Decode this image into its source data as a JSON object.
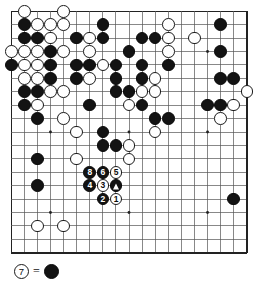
{
  "figure": {
    "kind": "go-board-diagram",
    "board_size": 19,
    "colors": {
      "black_stone": "#131313",
      "white_stone": "#ffffff",
      "stone_outline": "#1a1a1a",
      "grid_line": "#555555",
      "board_border": "#222222",
      "background": "#ffffff"
    },
    "grid": {
      "lines": 19,
      "show_star_points": true,
      "star_points": [
        [
          3,
          3
        ],
        [
          9,
          3
        ],
        [
          15,
          3
        ],
        [
          3,
          9
        ],
        [
          9,
          9
        ],
        [
          15,
          9
        ],
        [
          3,
          15
        ],
        [
          9,
          15
        ],
        [
          15,
          15
        ]
      ]
    }
  },
  "caption": {
    "move_stone": {
      "color": "white",
      "label": "7"
    },
    "equals": "=",
    "target_stone": {
      "color": "black",
      "mark": "triangle"
    },
    "text": "7 = triangle-marked black stone"
  },
  "move_sequence": [
    {
      "number": "1",
      "color": "white",
      "col": 8,
      "row": 14
    },
    {
      "number": "2",
      "color": "black",
      "col": 7,
      "row": 14
    },
    {
      "number": "3",
      "color": "white",
      "col": 7,
      "row": 13
    },
    {
      "number": "4",
      "color": "black",
      "col": 6,
      "row": 13
    },
    {
      "number": "5",
      "color": "white",
      "col": 8,
      "row": 12
    },
    {
      "number": "6",
      "color": "black",
      "col": 7,
      "row": 12
    },
    {
      "number": "8",
      "color": "black",
      "col": 6,
      "row": 12
    }
  ],
  "marked_stones": [
    {
      "color": "black",
      "mark": "triangle",
      "col": 8,
      "row": 13
    }
  ],
  "stones": [
    {
      "color": "white",
      "col": 1,
      "row": 0
    },
    {
      "color": "white",
      "col": 4,
      "row": 0
    },
    {
      "color": "black",
      "col": 1,
      "row": 1
    },
    {
      "color": "white",
      "col": 2,
      "row": 1
    },
    {
      "color": "white",
      "col": 3,
      "row": 1
    },
    {
      "color": "white",
      "col": 4,
      "row": 1
    },
    {
      "color": "black",
      "col": 7,
      "row": 1
    },
    {
      "color": "white",
      "col": 12,
      "row": 1
    },
    {
      "color": "black",
      "col": 16,
      "row": 1
    },
    {
      "color": "black",
      "col": 1,
      "row": 2
    },
    {
      "color": "black",
      "col": 2,
      "row": 2
    },
    {
      "color": "white",
      "col": 3,
      "row": 2
    },
    {
      "color": "black",
      "col": 5,
      "row": 2
    },
    {
      "color": "white",
      "col": 6,
      "row": 2
    },
    {
      "color": "black",
      "col": 7,
      "row": 2
    },
    {
      "color": "black",
      "col": 10,
      "row": 2
    },
    {
      "color": "black",
      "col": 11,
      "row": 2
    },
    {
      "color": "white",
      "col": 12,
      "row": 2
    },
    {
      "color": "white",
      "col": 14,
      "row": 2
    },
    {
      "color": "white",
      "col": 0,
      "row": 3
    },
    {
      "color": "white",
      "col": 1,
      "row": 3
    },
    {
      "color": "white",
      "col": 2,
      "row": 3
    },
    {
      "color": "black",
      "col": 3,
      "row": 3
    },
    {
      "color": "white",
      "col": 4,
      "row": 3
    },
    {
      "color": "white",
      "col": 6,
      "row": 3
    },
    {
      "color": "black",
      "col": 9,
      "row": 3
    },
    {
      "color": "white",
      "col": 12,
      "row": 3
    },
    {
      "color": "black",
      "col": 16,
      "row": 3
    },
    {
      "color": "black",
      "col": 0,
      "row": 4
    },
    {
      "color": "white",
      "col": 1,
      "row": 4
    },
    {
      "color": "white",
      "col": 2,
      "row": 4
    },
    {
      "color": "black",
      "col": 3,
      "row": 4
    },
    {
      "color": "black",
      "col": 5,
      "row": 4
    },
    {
      "color": "black",
      "col": 6,
      "row": 4
    },
    {
      "color": "white",
      "col": 7,
      "row": 4
    },
    {
      "color": "black",
      "col": 8,
      "row": 4
    },
    {
      "color": "black",
      "col": 10,
      "row": 4
    },
    {
      "color": "black",
      "col": 12,
      "row": 4
    },
    {
      "color": "white",
      "col": 1,
      "row": 5
    },
    {
      "color": "white",
      "col": 2,
      "row": 5
    },
    {
      "color": "black",
      "col": 3,
      "row": 5
    },
    {
      "color": "black",
      "col": 5,
      "row": 5
    },
    {
      "color": "white",
      "col": 6,
      "row": 5
    },
    {
      "color": "black",
      "col": 8,
      "row": 5
    },
    {
      "color": "black",
      "col": 10,
      "row": 5
    },
    {
      "color": "white",
      "col": 11,
      "row": 5
    },
    {
      "color": "black",
      "col": 16,
      "row": 5
    },
    {
      "color": "black",
      "col": 17,
      "row": 5
    },
    {
      "color": "black",
      "col": 1,
      "row": 6
    },
    {
      "color": "black",
      "col": 2,
      "row": 6
    },
    {
      "color": "white",
      "col": 3,
      "row": 6
    },
    {
      "color": "white",
      "col": 4,
      "row": 6
    },
    {
      "color": "black",
      "col": 8,
      "row": 6
    },
    {
      "color": "black",
      "col": 9,
      "row": 6
    },
    {
      "color": "white",
      "col": 10,
      "row": 6
    },
    {
      "color": "white",
      "col": 11,
      "row": 6
    },
    {
      "color": "white",
      "col": 18,
      "row": 6
    },
    {
      "color": "black",
      "col": 1,
      "row": 7
    },
    {
      "color": "white",
      "col": 2,
      "row": 7
    },
    {
      "color": "black",
      "col": 6,
      "row": 7
    },
    {
      "color": "white",
      "col": 9,
      "row": 7
    },
    {
      "color": "black",
      "col": 10,
      "row": 7
    },
    {
      "color": "black",
      "col": 15,
      "row": 7
    },
    {
      "color": "black",
      "col": 16,
      "row": 7
    },
    {
      "color": "white",
      "col": 17,
      "row": 7
    },
    {
      "color": "black",
      "col": 2,
      "row": 8
    },
    {
      "color": "white",
      "col": 4,
      "row": 8
    },
    {
      "color": "black",
      "col": 11,
      "row": 8
    },
    {
      "color": "black",
      "col": 12,
      "row": 8
    },
    {
      "color": "white",
      "col": 16,
      "row": 8
    },
    {
      "color": "white",
      "col": 5,
      "row": 9
    },
    {
      "color": "black",
      "col": 7,
      "row": 9
    },
    {
      "color": "white",
      "col": 11,
      "row": 9
    },
    {
      "color": "black",
      "col": 7,
      "row": 10
    },
    {
      "color": "black",
      "col": 8,
      "row": 10
    },
    {
      "color": "white",
      "col": 9,
      "row": 10
    },
    {
      "color": "black",
      "col": 2,
      "row": 11
    },
    {
      "color": "white",
      "col": 5,
      "row": 11
    },
    {
      "color": "white",
      "col": 9,
      "row": 11
    },
    {
      "color": "black",
      "col": 2,
      "row": 13
    },
    {
      "color": "black",
      "col": 17,
      "row": 14
    },
    {
      "color": "white",
      "col": 2,
      "row": 16
    },
    {
      "color": "white",
      "col": 4,
      "row": 16
    }
  ]
}
